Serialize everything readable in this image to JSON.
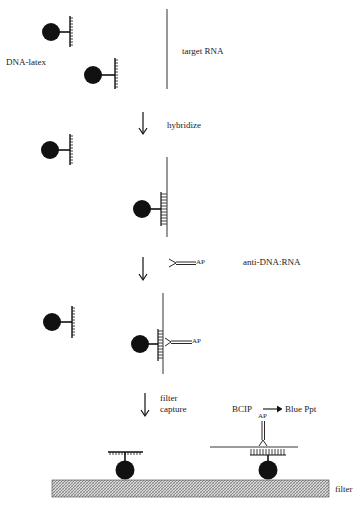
{
  "diagram": {
    "type": "assay schematic",
    "steps": [
      {
        "id": "step-1",
        "labels": {
          "bead_probe": "DNA-latex",
          "target": "target RNA"
        }
      },
      {
        "id": "step-2",
        "action": "hybridize"
      },
      {
        "id": "step-3",
        "action": "add antibody",
        "reagent_label": "anti-DNA:RNA",
        "enzyme_label": "AP"
      },
      {
        "id": "step-4",
        "action": "filter capture"
      },
      {
        "id": "step-5",
        "substrate": "BCIP",
        "product": "Blue Ppt",
        "surface": "filter"
      }
    ]
  },
  "labels": {
    "dna_latex": "DNA-latex",
    "target_rna": "target RNA",
    "hybridize": "hybridize",
    "ap_free": "AP",
    "anti_dna_rna": "anti-DNA:RNA",
    "ap_bound": "AP",
    "filter_line1": "filter",
    "filter_line2": "capture",
    "bcip": "BCIP",
    "blue_ppt": "Blue Ppt",
    "ap_filter": "AP",
    "filter": "filter"
  },
  "colors": {
    "ink": "#111111",
    "filter_fill": "#bdbdbd",
    "background": "#ffffff"
  }
}
